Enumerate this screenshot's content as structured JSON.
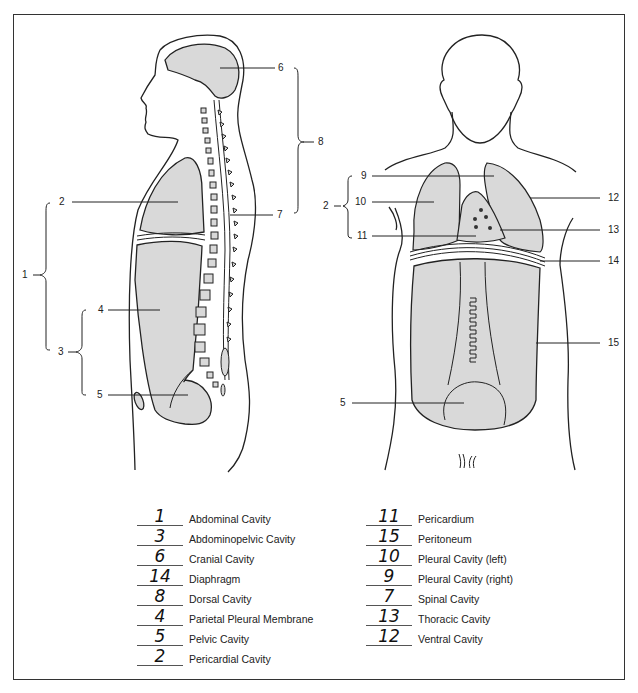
{
  "figure": {
    "fill_color": "#d9d9d9",
    "line_color": "#222222",
    "lateral_view": {
      "labels": [
        {
          "id": "6",
          "text": "6"
        },
        {
          "id": "8",
          "text": "8"
        },
        {
          "id": "2",
          "text": "2"
        },
        {
          "id": "7",
          "text": "7"
        },
        {
          "id": "1",
          "text": "1"
        },
        {
          "id": "4",
          "text": "4"
        },
        {
          "id": "3",
          "text": "3"
        },
        {
          "id": "5",
          "text": "5"
        }
      ]
    },
    "anterior_view": {
      "labels": [
        {
          "id": "9",
          "text": "9"
        },
        {
          "id": "2",
          "text": "2"
        },
        {
          "id": "10",
          "text": "10"
        },
        {
          "id": "11",
          "text": "11"
        },
        {
          "id": "12",
          "text": "12"
        },
        {
          "id": "13",
          "text": "13"
        },
        {
          "id": "14",
          "text": "14"
        },
        {
          "id": "15",
          "text": "15"
        },
        {
          "id": "5",
          "text": "5"
        }
      ]
    }
  },
  "answer_key": {
    "left_column": [
      {
        "answer": "1",
        "term": "Abdominal Cavity"
      },
      {
        "answer": "3",
        "term": "Abdominopelvic  Cavity"
      },
      {
        "answer": "6",
        "term": "Cranial Cavity"
      },
      {
        "answer": "14",
        "term": "Diaphragm"
      },
      {
        "answer": "8",
        "term": "Dorsal Cavity"
      },
      {
        "answer": "4",
        "term": "Parietal Pleural Membrane"
      },
      {
        "answer": "5",
        "term": "Pelvic Cavity"
      },
      {
        "answer": "2",
        "term": "Pericardial Cavity"
      }
    ],
    "right_column": [
      {
        "answer": "11",
        "term": "Pericardium"
      },
      {
        "answer": "15",
        "term": "Peritoneum"
      },
      {
        "answer": "10",
        "term": "Pleural Cavity (left)"
      },
      {
        "answer": "9",
        "term": "Pleural Cavity (right)"
      },
      {
        "answer": "7",
        "term": "Spinal Cavity"
      },
      {
        "answer": "13",
        "term": "Thoracic Cavity"
      },
      {
        "answer": "12",
        "term": "Ventral Cavity"
      }
    ]
  }
}
